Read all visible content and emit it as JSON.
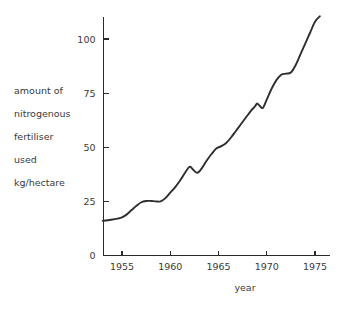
{
  "chart_data": {
    "type": "line",
    "title": "",
    "xlabel": "year",
    "ylabel": "amount of nitrogenous fertiliser used kg/hectare",
    "ylabel_lines": [
      "amount of",
      "nitrogenous",
      "fertiliser",
      "used",
      "kg/hectare"
    ],
    "xlim": [
      1953,
      1976
    ],
    "ylim": [
      0,
      115
    ],
    "grid": false,
    "legend": "none",
    "line_color": "#2e2e2e",
    "xticks": [
      1955,
      1960,
      1965,
      1970,
      1975
    ],
    "xtick_labels": [
      "1955",
      "1960",
      "1965",
      "1970",
      "1975"
    ],
    "yticks": [
      0,
      25,
      50,
      75,
      100
    ],
    "ytick_labels": [
      "0",
      "25",
      "50",
      "75",
      "100"
    ],
    "units": "kg/hectare",
    "series": [
      {
        "name": "nitrogenous fertiliser used",
        "x": [
          1953.0,
          1953.5,
          1954.0,
          1954.5,
          1955.0,
          1955.5,
          1956.0,
          1956.5,
          1957.0,
          1957.5,
          1958.0,
          1958.5,
          1959.0,
          1959.5,
          1960.0,
          1960.5,
          1961.0,
          1961.5,
          1962.0,
          1962.3,
          1962.8,
          1963.3,
          1963.8,
          1964.3,
          1964.8,
          1965.3,
          1965.8,
          1966.3,
          1966.8,
          1967.3,
          1967.8,
          1968.3,
          1968.8,
          1969.0,
          1969.3,
          1969.6,
          1970.0,
          1970.5,
          1971.0,
          1971.5,
          1972.0,
          1972.5,
          1973.0,
          1973.5,
          1974.0,
          1974.5,
          1975.0,
          1975.5
        ],
        "y": [
          16.0,
          16.3,
          16.6,
          17.0,
          17.6,
          19.0,
          21.0,
          23.0,
          24.6,
          25.2,
          25.2,
          25.0,
          25.0,
          26.5,
          29.0,
          31.5,
          34.5,
          38.0,
          41.0,
          40.0,
          38.2,
          40.5,
          44.0,
          47.0,
          49.5,
          50.5,
          52.0,
          54.5,
          57.5,
          60.5,
          63.5,
          66.5,
          69.0,
          70.2,
          69.0,
          68.2,
          72.0,
          77.0,
          81.0,
          83.5,
          84.0,
          84.5,
          88.0,
          93.0,
          98.0,
          103.0,
          108.0,
          110.5
        ]
      }
    ]
  },
  "axes": {
    "y_axis_name": "y-axis",
    "x_axis_name": "x-axis"
  }
}
